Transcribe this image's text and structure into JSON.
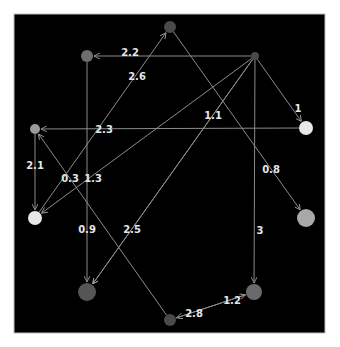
{
  "diagram": {
    "type": "directed-weighted-graph",
    "background": "#000000",
    "frame": {
      "x": 14,
      "y": 14,
      "w": 311,
      "h": 319
    },
    "edge_color": "#8c8c8c",
    "nodes": [
      {
        "id": "A",
        "x": 170,
        "y": 27,
        "r": 6,
        "color": "#4a4a4a"
      },
      {
        "id": "B",
        "x": 87,
        "y": 56,
        "r": 6,
        "color": "#6e6e6e"
      },
      {
        "id": "C",
        "x": 255,
        "y": 56,
        "r": 4,
        "color": "#4a4a4a"
      },
      {
        "id": "D",
        "x": 35,
        "y": 129,
        "r": 5,
        "color": "#9a9a9a"
      },
      {
        "id": "E",
        "x": 306,
        "y": 128,
        "r": 7,
        "color": "#e8e8e8"
      },
      {
        "id": "F",
        "x": 35,
        "y": 218,
        "r": 7,
        "color": "#e8e8e8"
      },
      {
        "id": "G",
        "x": 306,
        "y": 218,
        "r": 9,
        "color": "#a8a8a8"
      },
      {
        "id": "H",
        "x": 87,
        "y": 292,
        "r": 9,
        "color": "#555555"
      },
      {
        "id": "I",
        "x": 254,
        "y": 292,
        "r": 8,
        "color": "#6a6a6a"
      },
      {
        "id": "J",
        "x": 170,
        "y": 320,
        "r": 6,
        "color": "#4a4a4a"
      }
    ],
    "edges": [
      {
        "from": "C",
        "to": "B",
        "label": "2.2",
        "lx": 130,
        "ly": 52
      },
      {
        "from": "F",
        "to": "A",
        "label": "2.6",
        "lx": 137,
        "ly": 76
      },
      {
        "from": "C",
        "to": "E",
        "label": "1",
        "lx": 298,
        "ly": 108
      },
      {
        "from": "E",
        "to": "D",
        "label": "2.3",
        "lx": 104,
        "ly": 129
      },
      {
        "from": "C",
        "to": "F",
        "label": "1.3",
        "lx": 93,
        "ly": 178
      },
      {
        "from": "C",
        "to": "H",
        "label": "1.1",
        "lx": 213,
        "ly": 115
      },
      {
        "from": "C",
        "to": "H",
        "label": "2.5",
        "lx": 132,
        "ly": 229
      },
      {
        "from": "A",
        "to": "G",
        "label": "0.8",
        "lx": 271,
        "ly": 169
      },
      {
        "from": "D",
        "to": "F",
        "label": "2.1",
        "lx": 35,
        "ly": 165
      },
      {
        "from": "B",
        "to": "H",
        "label": "0.9",
        "lx": 87,
        "ly": 229
      },
      {
        "from": "C",
        "to": "I",
        "label": "3",
        "lx": 260,
        "ly": 230
      },
      {
        "from": "J",
        "to": "D",
        "label": "0.3",
        "lx": 70,
        "ly": 178
      },
      {
        "from": "I",
        "to": "J",
        "label": "2.8",
        "lx": 194,
        "ly": 313
      },
      {
        "from": "J",
        "to": "I",
        "label": "1.2",
        "lx": 232,
        "ly": 300
      }
    ]
  }
}
